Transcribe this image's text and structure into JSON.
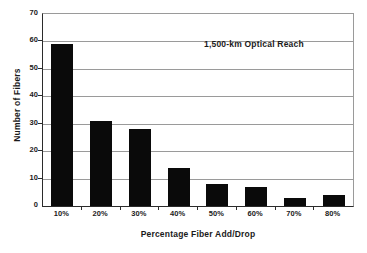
{
  "chart_data": {
    "type": "bar",
    "title": "",
    "annotation": "1,500-km Optical Reach",
    "xlabel": "Percentage Fiber Add/Drop",
    "ylabel": "Number of Fibers",
    "categories": [
      "10%",
      "20%",
      "30%",
      "40%",
      "50%",
      "60%",
      "70%",
      "80%"
    ],
    "values": [
      59,
      31,
      28,
      14,
      8,
      7,
      3,
      4
    ],
    "ylim": [
      0,
      70
    ],
    "yticks": [
      0,
      10,
      20,
      30,
      40,
      50,
      60,
      70
    ],
    "ytick_labels": [
      "0",
      "10",
      "20",
      "30",
      "40",
      "50",
      "60",
      "70"
    ],
    "grid": "horizontal",
    "legend": "none",
    "bar_color": "#0a0a0a",
    "grid_color": "#9a9a9a",
    "axis_color": "#2b2b2b",
    "background_color": "#ffffff"
  }
}
